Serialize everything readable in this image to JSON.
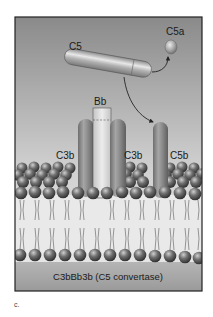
{
  "figure": {
    "panel_letter": "c.",
    "caption": "C3bBb3b (C5 convertase)",
    "labels": {
      "c5": "C5",
      "c5a": "C5a",
      "bb": "Bb",
      "c3b_left": "C3b",
      "c3b_right": "C3b",
      "c5b": "C5b"
    },
    "colors": {
      "background_top": "#8a8a8a",
      "background_bottom": "#e6e6e6",
      "lower_band": "#a8a8a8",
      "frame": "#222222",
      "protein": "#8c8c8c",
      "bb_fill": "#d8d8d8",
      "lipid_head": "#5a5a5a",
      "lipid_tail": "#777777"
    }
  }
}
